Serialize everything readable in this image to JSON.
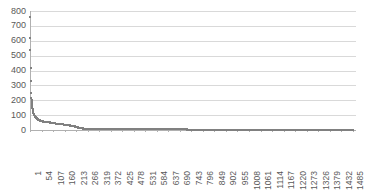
{
  "chart_data": {
    "type": "scatter",
    "title": "",
    "subtitle": "",
    "xlabel": "",
    "ylabel": "",
    "xlim": [
      1,
      1500
    ],
    "ylim": [
      0,
      800
    ],
    "grid": true,
    "legend": false,
    "legend_position": "none",
    "marker": "square",
    "marker_color": "#808080",
    "y_ticks": [
      800,
      700,
      600,
      500,
      400,
      300,
      200,
      100,
      0
    ],
    "y_tick_labels": [
      "800",
      "700",
      "600",
      "500",
      "400",
      "300",
      "200",
      "100",
      "0"
    ],
    "x_ticks": [
      1,
      54,
      107,
      160,
      213,
      266,
      319,
      372,
      425,
      478,
      531,
      584,
      637,
      690,
      743,
      796,
      849,
      902,
      955,
      1008,
      1061,
      1114,
      1167,
      1220,
      1273,
      1326,
      1379,
      1432,
      1485
    ],
    "x_tick_labels": [
      "1",
      "54",
      "107",
      "160",
      "213",
      "266",
      "319",
      "372",
      "425",
      "478",
      "531",
      "584",
      "637",
      "690",
      "743",
      "796",
      "849",
      "902",
      "955",
      "1008",
      "1061",
      "1114",
      "1167",
      "1220",
      "1273",
      "1326",
      "1379",
      "1432",
      "1485"
    ],
    "x_tick_label_rotation": -90,
    "x": [
      1,
      2,
      3,
      4,
      5,
      6,
      7,
      8,
      9,
      10,
      11,
      12,
      13,
      14,
      15,
      16,
      17,
      18,
      19,
      20,
      22,
      24,
      26,
      28,
      30,
      33,
      36,
      40,
      44,
      48,
      52,
      56,
      60,
      65,
      70,
      75,
      80,
      85,
      90,
      95,
      100,
      107,
      114,
      121,
      128,
      135,
      142,
      150,
      160,
      170,
      180,
      190,
      200,
      213,
      225,
      240,
      255,
      270,
      290,
      310,
      330,
      350,
      372,
      400,
      430,
      460,
      490,
      520,
      560,
      600,
      640,
      690,
      740,
      790,
      850,
      910,
      970,
      1030,
      1090,
      1150,
      1220,
      1290,
      1360,
      1430,
      1485
    ],
    "y": [
      760,
      620,
      540,
      420,
      330,
      250,
      215,
      200,
      185,
      172,
      160,
      150,
      140,
      133,
      126,
      120,
      115,
      110,
      106,
      100,
      95,
      90,
      86,
      83,
      80,
      76,
      73,
      69,
      66,
      64,
      62,
      60,
      58,
      56,
      55,
      54,
      53,
      52,
      51,
      50,
      49,
      47,
      45,
      43,
      42,
      41,
      40,
      39,
      35,
      33,
      31,
      29,
      27,
      22,
      16,
      11,
      9,
      8,
      7,
      7,
      6,
      6,
      6,
      5,
      5,
      5,
      5,
      4,
      4,
      4,
      4,
      4,
      3,
      3,
      3,
      3,
      3,
      3,
      2,
      2,
      2,
      2,
      2,
      2,
      2
    ]
  }
}
